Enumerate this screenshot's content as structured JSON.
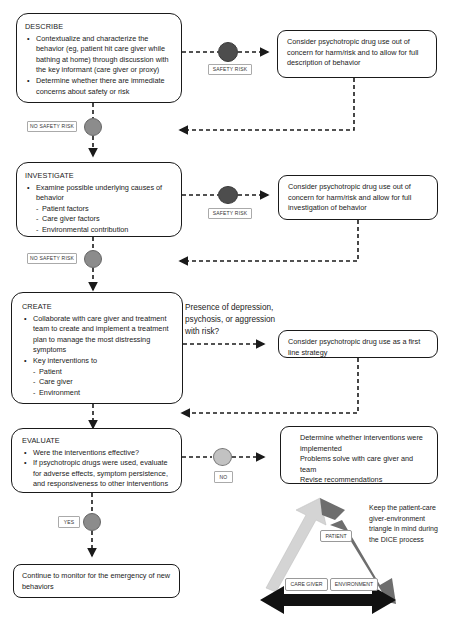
{
  "describe": {
    "title": "DESCRIBE",
    "bullets": [
      "Contextualize and characterize the behavior (eg, patient hit care giver while bathing at home) through discussion with the key informant (care giver or proxy)",
      "Determine whether there are immediate concerns about safety or risk"
    ],
    "safety_risk_label": "SAFETY RISK",
    "no_safety_risk_label": "NO SAFETY RISK",
    "side_text": "Consider psychotropic drug use out of concern for harm/risk and to allow for full description of behavior"
  },
  "investigate": {
    "title": "INVESTIGATE",
    "bullet": "Examine possible underlying causes of behavior",
    "sub_items": [
      "Patient factors",
      "Care giver factors",
      "Environmental contribution"
    ],
    "safety_risk_label": "SAFETY RISK",
    "no_safety_risk_label": "NO SAFETY RISK",
    "side_text": "Consider psychotropic drug use out of concern for harm/risk and allow for full investigation of behavior"
  },
  "create": {
    "title": "CREATE",
    "bullet1": "Collaborate with care giver and treatment team to create and implement a treatment plan to manage the most distressing symptoms",
    "bullet2": "Key interventions to",
    "sub_items": [
      "Patient",
      "Care giver",
      "Environment"
    ],
    "question": "Presence of depression, psychosis, or aggression with risk?",
    "side_text": "Consider psychotropic drug use as a first line strategy"
  },
  "evaluate": {
    "title": "EVALUATE",
    "bullets": [
      "Were the interventions effective?",
      "If psychotropic drugs were used, evaluate for adverse effects, symptom persistence, and responsiveness to other interventions"
    ],
    "no_label": "NO",
    "yes_label": "YES",
    "side_bullets": [
      "Determine whether interventions were implemented",
      "Problems solve with care giver and team",
      "Revise recommendations"
    ]
  },
  "monitor": {
    "text": "Continue to monitor for the emergency of new behaviors"
  },
  "triangle": {
    "note": "Keep the patient-care giver-environment triangle in mind during the DICE process",
    "labels": {
      "patient": "PATIENT",
      "care_giver": "CARE GIVER",
      "environment": "ENVIRONMENT"
    },
    "colors": {
      "left_arrow": "#d4d4d4",
      "right_arrow": "#6e6e6e",
      "bottom_arrow": "#111111"
    }
  },
  "colors": {
    "dot_dark": "#4d4d4d",
    "dot_mid": "#8c8c8c",
    "dot_light": "#c2c2c2",
    "line": "#1a1a1a"
  }
}
